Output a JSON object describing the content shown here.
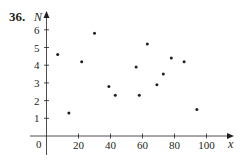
{
  "problem": {
    "number": "36."
  },
  "chart_data": {
    "type": "scatter",
    "title": "",
    "xlabel": "x",
    "ylabel": "N",
    "xlim": [
      0,
      110
    ],
    "ylim": [
      0,
      6.8
    ],
    "origin_label": "0",
    "x_ticks": [
      20,
      40,
      60,
      80,
      100
    ],
    "x_tick_labels": [
      "20",
      "40",
      "60",
      "80",
      "100"
    ],
    "y_ticks": [
      1,
      2,
      3,
      4,
      5,
      6
    ],
    "y_tick_labels": [
      "1",
      "2",
      "3",
      "4",
      "5",
      "6"
    ],
    "grid": false,
    "legend": null,
    "points": [
      {
        "x": 7,
        "y": 4.6
      },
      {
        "x": 14,
        "y": 1.3
      },
      {
        "x": 22,
        "y": 4.2
      },
      {
        "x": 30,
        "y": 5.8
      },
      {
        "x": 39,
        "y": 2.8
      },
      {
        "x": 43,
        "y": 2.3
      },
      {
        "x": 56,
        "y": 3.9
      },
      {
        "x": 58,
        "y": 2.3
      },
      {
        "x": 63,
        "y": 5.2
      },
      {
        "x": 69,
        "y": 2.9
      },
      {
        "x": 73,
        "y": 3.5
      },
      {
        "x": 78,
        "y": 4.4
      },
      {
        "x": 86,
        "y": 4.2
      },
      {
        "x": 94,
        "y": 1.5
      }
    ],
    "colors": {
      "ink": "#231f20",
      "background": "#ffffff"
    }
  }
}
